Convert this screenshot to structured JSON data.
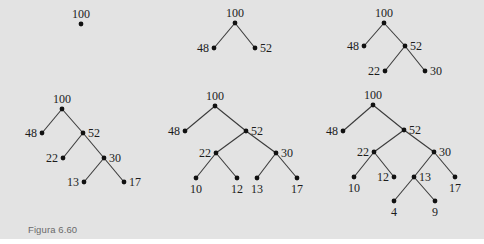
{
  "caption": "Figura 6.60",
  "colors": {
    "background": "#e3e3e3",
    "node": "#111111",
    "edge": "#3a3a3a",
    "caption": "#6a6a6a"
  },
  "trees": [
    {
      "id": "tree-1",
      "nodes": [
        {
          "id": "a",
          "label": "100",
          "x": 81,
          "y": 24,
          "label_pos": "top"
        }
      ],
      "edges": []
    },
    {
      "id": "tree-2",
      "nodes": [
        {
          "id": "a",
          "label": "100",
          "x": 235,
          "y": 23,
          "label_pos": "top"
        },
        {
          "id": "b",
          "label": "48",
          "x": 214,
          "y": 48,
          "label_pos": "left"
        },
        {
          "id": "c",
          "label": "52",
          "x": 255,
          "y": 48,
          "label_pos": "right"
        }
      ],
      "edges": [
        [
          "a",
          "b"
        ],
        [
          "a",
          "c"
        ]
      ]
    },
    {
      "id": "tree-3",
      "nodes": [
        {
          "id": "a",
          "label": "100",
          "x": 384,
          "y": 23,
          "label_pos": "top"
        },
        {
          "id": "b",
          "label": "48",
          "x": 364,
          "y": 46,
          "label_pos": "left"
        },
        {
          "id": "c",
          "label": "52",
          "x": 405,
          "y": 46,
          "label_pos": "right"
        },
        {
          "id": "d",
          "label": "22",
          "x": 385,
          "y": 71,
          "label_pos": "left"
        },
        {
          "id": "e",
          "label": "30",
          "x": 425,
          "y": 71,
          "label_pos": "right"
        }
      ],
      "edges": [
        [
          "a",
          "b"
        ],
        [
          "a",
          "c"
        ],
        [
          "c",
          "d"
        ],
        [
          "c",
          "e"
        ]
      ]
    },
    {
      "id": "tree-4",
      "nodes": [
        {
          "id": "a",
          "label": "100",
          "x": 62,
          "y": 109,
          "label_pos": "top"
        },
        {
          "id": "b",
          "label": "48",
          "x": 42,
          "y": 133,
          "label_pos": "left"
        },
        {
          "id": "c",
          "label": "52",
          "x": 83,
          "y": 133,
          "label_pos": "right"
        },
        {
          "id": "d",
          "label": "22",
          "x": 63,
          "y": 158,
          "label_pos": "left"
        },
        {
          "id": "e",
          "label": "30",
          "x": 104,
          "y": 158,
          "label_pos": "right"
        },
        {
          "id": "f",
          "label": "13",
          "x": 84,
          "y": 182,
          "label_pos": "left"
        },
        {
          "id": "g",
          "label": "17",
          "x": 124,
          "y": 182,
          "label_pos": "right"
        }
      ],
      "edges": [
        [
          "a",
          "b"
        ],
        [
          "a",
          "c"
        ],
        [
          "c",
          "d"
        ],
        [
          "c",
          "e"
        ],
        [
          "e",
          "f"
        ],
        [
          "e",
          "g"
        ]
      ]
    },
    {
      "id": "tree-5",
      "nodes": [
        {
          "id": "a",
          "label": "100",
          "x": 215,
          "y": 106,
          "label_pos": "top"
        },
        {
          "id": "b",
          "label": "48",
          "x": 185,
          "y": 131,
          "label_pos": "left"
        },
        {
          "id": "c",
          "label": "52",
          "x": 246,
          "y": 131,
          "label_pos": "right"
        },
        {
          "id": "d",
          "label": "22",
          "x": 216,
          "y": 153,
          "label_pos": "left"
        },
        {
          "id": "e",
          "label": "30",
          "x": 276,
          "y": 153,
          "label_pos": "right"
        },
        {
          "id": "f",
          "label": "10",
          "x": 196,
          "y": 178,
          "label_pos": "bottom"
        },
        {
          "id": "g",
          "label": "12",
          "x": 237,
          "y": 178,
          "label_pos": "bottom"
        },
        {
          "id": "h",
          "label": "13",
          "x": 257,
          "y": 178,
          "label_pos": "bottom"
        },
        {
          "id": "i",
          "label": "17",
          "x": 297,
          "y": 178,
          "label_pos": "bottom"
        }
      ],
      "edges": [
        [
          "a",
          "b"
        ],
        [
          "a",
          "c"
        ],
        [
          "c",
          "d"
        ],
        [
          "c",
          "e"
        ],
        [
          "d",
          "f"
        ],
        [
          "d",
          "g"
        ],
        [
          "e",
          "h"
        ],
        [
          "e",
          "i"
        ]
      ]
    },
    {
      "id": "tree-6",
      "nodes": [
        {
          "id": "a",
          "label": "100",
          "x": 373,
          "y": 105,
          "label_pos": "top"
        },
        {
          "id": "b",
          "label": "48",
          "x": 343,
          "y": 131,
          "label_pos": "left"
        },
        {
          "id": "c",
          "label": "52",
          "x": 404,
          "y": 130,
          "label_pos": "right"
        },
        {
          "id": "d",
          "label": "22",
          "x": 374,
          "y": 152,
          "label_pos": "left"
        },
        {
          "id": "e",
          "label": "30",
          "x": 434,
          "y": 152,
          "label_pos": "right"
        },
        {
          "id": "f",
          "label": "10",
          "x": 354,
          "y": 177,
          "label_pos": "bottom"
        },
        {
          "id": "g",
          "label": "12",
          "x": 394,
          "y": 177,
          "label_pos": "left"
        },
        {
          "id": "h",
          "label": "13",
          "x": 414,
          "y": 177,
          "label_pos": "right"
        },
        {
          "id": "i",
          "label": "17",
          "x": 455,
          "y": 177,
          "label_pos": "bottom"
        },
        {
          "id": "j",
          "label": "4",
          "x": 394,
          "y": 201,
          "label_pos": "bottom"
        },
        {
          "id": "k",
          "label": "9",
          "x": 435,
          "y": 201,
          "label_pos": "bottom"
        }
      ],
      "edges": [
        [
          "a",
          "b"
        ],
        [
          "a",
          "c"
        ],
        [
          "c",
          "d"
        ],
        [
          "c",
          "e"
        ],
        [
          "d",
          "f"
        ],
        [
          "d",
          "g"
        ],
        [
          "e",
          "h"
        ],
        [
          "e",
          "i"
        ],
        [
          "h",
          "j"
        ],
        [
          "h",
          "k"
        ]
      ]
    }
  ]
}
